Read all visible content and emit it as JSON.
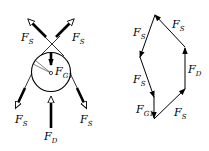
{
  "left_diagram": {
    "description": "Free-body diagram of pulley",
    "labels": {
      "fs_top_left": {
        "main": "F",
        "sub": "S"
      },
      "fs_top_right": {
        "main": "F",
        "sub": "S"
      },
      "fg": {
        "main": "F",
        "sub": "G1"
      },
      "fs_bottom_left": {
        "main": "F",
        "sub": "S"
      },
      "fs_bottom_right": {
        "main": "F",
        "sub": "S"
      },
      "fd": {
        "main": "F",
        "sub": "D"
      }
    }
  },
  "right_diagram": {
    "description": "Force polygon",
    "labels": {
      "fs_left_upper": {
        "main": "F",
        "sub": "S"
      },
      "fs_top_right": {
        "main": "F",
        "sub": "S"
      },
      "fs_left_lower": {
        "main": "F",
        "sub": "S"
      },
      "fd": {
        "main": "F",
        "sub": "D"
      },
      "fg": {
        "main": "F",
        "sub": "G1"
      },
      "fs_bottom_right": {
        "main": "F",
        "sub": "S"
      }
    }
  }
}
